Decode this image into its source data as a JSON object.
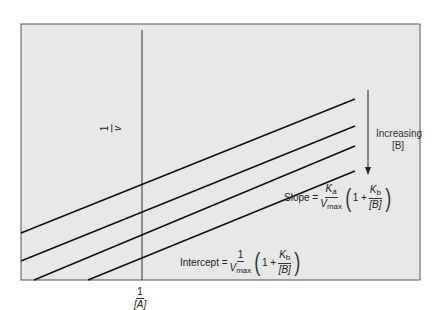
{
  "figure": {
    "type": "Lineweaver-Burk double-reciprocal plot, family of lines",
    "background_color": "#e8e8e8",
    "line_color": "#111111"
  },
  "axes": {
    "y_label": {
      "numerator": "1",
      "denominator": "v"
    },
    "x_label": {
      "numerator": "1",
      "denominator": "[A]"
    }
  },
  "lines": [
    {
      "name": "line-1",
      "order": 1
    },
    {
      "name": "line-2",
      "order": 2
    },
    {
      "name": "line-3",
      "order": 3
    },
    {
      "name": "line-4",
      "order": 4
    }
  ],
  "annotations": {
    "arrow_label_line1": "Increasing",
    "arrow_label_line2": "[B]",
    "slope": {
      "label": "Slope =",
      "frac1_num": "K",
      "frac1_num_sub": "a",
      "frac1_den": "V",
      "frac1_den_sub": "max",
      "one_plus": "1 +",
      "frac2_num": "K",
      "frac2_num_sub": "b",
      "frac2_den": "[B]"
    },
    "intercept": {
      "label": "Intercept =",
      "frac1_num": "1",
      "frac1_den": "V",
      "frac1_den_sub": "max",
      "one_plus": "1 +",
      "frac2_num": "K",
      "frac2_num_sub": "b",
      "frac2_den": "[B]"
    }
  }
}
